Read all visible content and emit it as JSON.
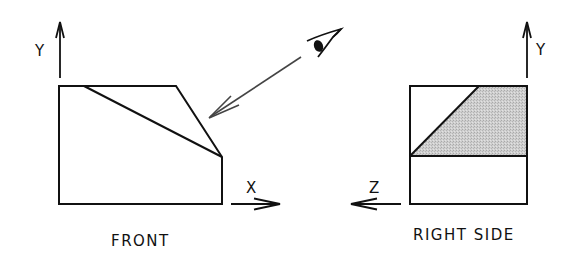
{
  "diagram": {
    "type": "orthographic-projection",
    "colors": {
      "line": "#111111",
      "view_arrow": "#444444",
      "shade": "#c8c8c8",
      "background": "#ffffff"
    },
    "front_view": {
      "label": "FRONT",
      "axes": {
        "vertical": "Y",
        "horizontal": "X"
      }
    },
    "right_side_view": {
      "label": "RIGHT SIDE",
      "axes": {
        "vertical": "Y",
        "horizontal": "Z"
      },
      "shaded_region": "inclined surface"
    },
    "viewer": {
      "icon": "eye-icon",
      "direction": "line of sight toward the inclined surface of the front view"
    }
  }
}
